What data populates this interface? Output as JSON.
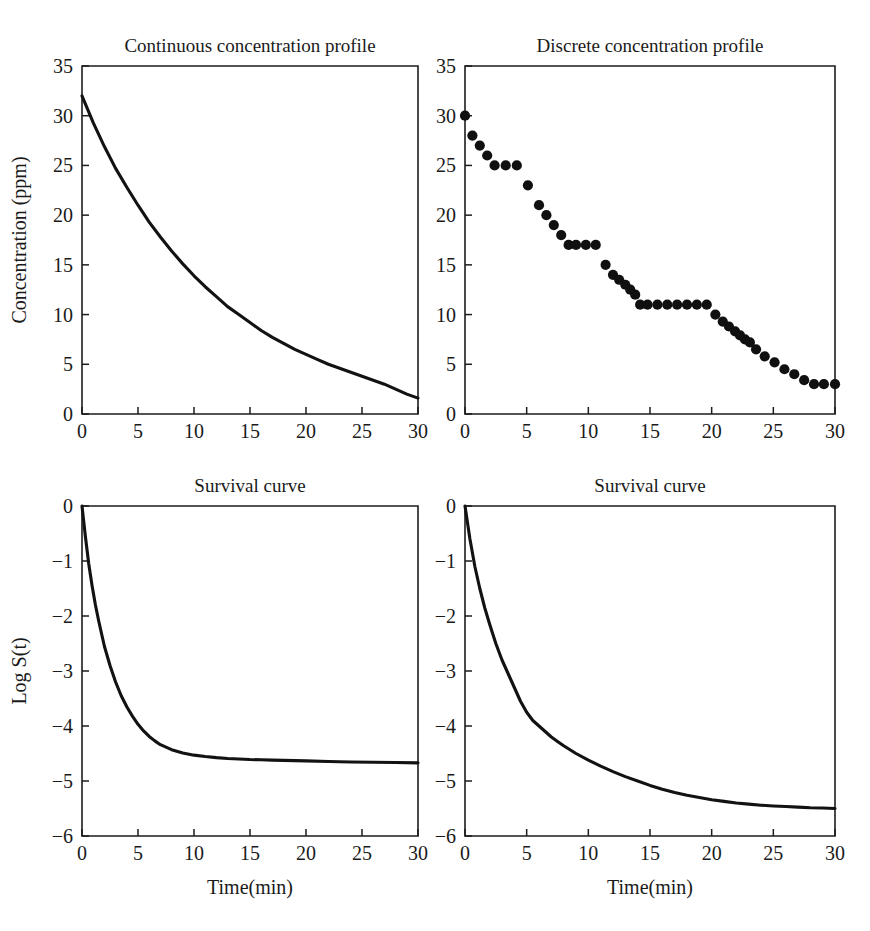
{
  "figure": {
    "background": "#ffffff",
    "line_color": "#121212",
    "axis_color": "#1d1d1d"
  },
  "panels": {
    "top_left": {
      "title": "Continuous concentration profile",
      "xlabel": "",
      "ylabel": "Concentration (ppm)"
    },
    "top_right": {
      "title": "Discrete concentration profile",
      "xlabel": "",
      "ylabel": ""
    },
    "bottom_left": {
      "title": "Survival curve",
      "xlabel": "Time(min)",
      "ylabel": "Log S(t)"
    },
    "bottom_right": {
      "title": "Survival curve",
      "xlabel": "Time(min)",
      "ylabel": ""
    }
  },
  "chart_data": [
    {
      "id": "continuous-concentration-profile",
      "type": "line",
      "title": "Continuous concentration profile",
      "xlabel": "",
      "ylabel": "Concentration (ppm)",
      "xlim": [
        0,
        30
      ],
      "ylim": [
        0,
        35
      ],
      "xticks": [
        0,
        5,
        10,
        15,
        20,
        25,
        30
      ],
      "yticks": [
        0,
        5,
        10,
        15,
        20,
        25,
        30,
        35
      ],
      "xticklabels": [
        "0",
        "5",
        "10",
        "15",
        "20",
        "25",
        "30"
      ],
      "yticklabels": [
        "0",
        "5",
        "10",
        "15",
        "20",
        "25",
        "30",
        "35"
      ],
      "grid": false,
      "legend": false,
      "series": [
        {
          "name": "concentration",
          "x": [
            0,
            1,
            2,
            3,
            4,
            5,
            6,
            7,
            8,
            9,
            10,
            11,
            12,
            13,
            14,
            15,
            16,
            17,
            18,
            19,
            20,
            21,
            22,
            23,
            24,
            25,
            26,
            27,
            28,
            29,
            30
          ],
          "y": [
            32.0,
            29.3,
            26.9,
            24.7,
            22.8,
            21.0,
            19.3,
            17.8,
            16.4,
            15.1,
            13.9,
            12.8,
            11.8,
            10.8,
            10.0,
            9.2,
            8.4,
            7.7,
            7.1,
            6.5,
            6.0,
            5.5,
            5.0,
            4.6,
            4.2,
            3.8,
            3.4,
            3.0,
            2.5,
            2.0,
            1.6
          ]
        }
      ]
    },
    {
      "id": "discrete-concentration-profile",
      "type": "scatter",
      "title": "Discrete concentration profile",
      "xlabel": "",
      "ylabel": "",
      "xlim": [
        0,
        30
      ],
      "ylim": [
        0,
        35
      ],
      "xticks": [
        0,
        5,
        10,
        15,
        20,
        25,
        30
      ],
      "yticks": [
        0,
        5,
        10,
        15,
        20,
        25,
        30,
        35
      ],
      "xticklabels": [
        "0",
        "5",
        "10",
        "15",
        "20",
        "25",
        "30"
      ],
      "yticklabels": [
        "0",
        "5",
        "10",
        "15",
        "20",
        "25",
        "30",
        "35"
      ],
      "grid": false,
      "legend": false,
      "marker": "filled-circle",
      "series": [
        {
          "name": "concentration",
          "x": [
            0,
            0.6,
            1.2,
            1.8,
            2.4,
            3.3,
            4.2,
            5.1,
            6.0,
            6.6,
            7.2,
            7.8,
            8.4,
            9.0,
            9.8,
            10.6,
            11.4,
            12.0,
            12.5,
            13.0,
            13.4,
            13.8,
            14.2,
            14.8,
            15.6,
            16.4,
            17.2,
            18.0,
            18.8,
            19.6,
            20.3,
            20.9,
            21.4,
            21.9,
            22.3,
            22.7,
            23.1,
            23.6,
            24.3,
            25.1,
            25.9,
            26.7,
            27.5,
            28.3,
            29.1,
            30.0
          ],
          "y": [
            30,
            28,
            27,
            26,
            25,
            25,
            25,
            23,
            21,
            20,
            19,
            18,
            17,
            17,
            17,
            17,
            15,
            14,
            13.5,
            13,
            12.5,
            12,
            11,
            11,
            11,
            11,
            11,
            11,
            11,
            11,
            10,
            9.3,
            8.8,
            8.3,
            7.9,
            7.5,
            7.2,
            6.5,
            5.8,
            5.2,
            4.5,
            4.0,
            3.4,
            3.0,
            3.0,
            3.0
          ]
        }
      ]
    },
    {
      "id": "survival-curve-continuous",
      "type": "line",
      "title": "Survival curve",
      "xlabel": "Time(min)",
      "ylabel": "Log S(t)",
      "xlim": [
        0,
        30
      ],
      "ylim": [
        -6,
        0
      ],
      "xticks": [
        0,
        5,
        10,
        15,
        20,
        25,
        30
      ],
      "yticks": [
        -6,
        -5,
        -4,
        -3,
        -2,
        -1,
        0
      ],
      "xticklabels": [
        "0",
        "5",
        "10",
        "15",
        "20",
        "25",
        "30"
      ],
      "yticklabels": [
        "−6",
        "−5",
        "−4",
        "−3",
        "−2",
        "−1",
        "0"
      ],
      "grid": false,
      "legend": false,
      "series": [
        {
          "name": "log-survival",
          "x": [
            0,
            0.3,
            0.6,
            0.9,
            1.2,
            1.5,
            2.0,
            2.5,
            3.0,
            3.5,
            4.0,
            4.5,
            5.0,
            5.5,
            6.0,
            6.5,
            7.0,
            8.0,
            9.0,
            10.0,
            11.0,
            12.0,
            13.0,
            14.0,
            15.0,
            16.0,
            17.0,
            18.0,
            19.0,
            20.0,
            22.0,
            24.0,
            26.0,
            28.0,
            30.0
          ],
          "y": [
            0.0,
            -0.55,
            -1.05,
            -1.45,
            -1.8,
            -2.1,
            -2.55,
            -2.9,
            -3.2,
            -3.45,
            -3.65,
            -3.82,
            -3.97,
            -4.09,
            -4.19,
            -4.27,
            -4.34,
            -4.43,
            -4.49,
            -4.53,
            -4.555,
            -4.575,
            -4.59,
            -4.6,
            -4.61,
            -4.615,
            -4.62,
            -4.625,
            -4.63,
            -4.635,
            -4.645,
            -4.655,
            -4.66,
            -4.665,
            -4.67
          ]
        }
      ]
    },
    {
      "id": "survival-curve-discrete",
      "type": "line",
      "title": "Survival curve",
      "xlabel": "Time(min)",
      "ylabel": "",
      "xlim": [
        0,
        30
      ],
      "ylim": [
        -6,
        0
      ],
      "xticks": [
        0,
        5,
        10,
        15,
        20,
        25,
        30
      ],
      "yticks": [
        -6,
        -5,
        -4,
        -3,
        -2,
        -1,
        0
      ],
      "xticklabels": [
        "0",
        "5",
        "10",
        "15",
        "20",
        "25",
        "30"
      ],
      "yticklabels": [
        "−6",
        "−5",
        "−4",
        "−3",
        "−2",
        "−1",
        "0"
      ],
      "grid": false,
      "legend": false,
      "series": [
        {
          "name": "log-survival",
          "x": [
            0,
            0.4,
            0.8,
            1.2,
            1.6,
            2.0,
            2.5,
            3.0,
            3.5,
            4.0,
            4.5,
            5.0,
            5.5,
            6.0,
            6.5,
            7.0,
            7.5,
            8.0,
            9.0,
            10.0,
            11.0,
            12.0,
            13.0,
            14.0,
            15.0,
            16.0,
            17.0,
            18.0,
            19.0,
            20.0,
            21.0,
            22.0,
            23.0,
            24.0,
            25.0,
            26.0,
            27.0,
            28.0,
            29.0,
            30.0
          ],
          "y": [
            0.0,
            -0.6,
            -1.1,
            -1.5,
            -1.85,
            -2.15,
            -2.5,
            -2.8,
            -3.05,
            -3.3,
            -3.55,
            -3.75,
            -3.9,
            -4.0,
            -4.1,
            -4.2,
            -4.28,
            -4.36,
            -4.5,
            -4.62,
            -4.73,
            -4.83,
            -4.92,
            -5.0,
            -5.08,
            -5.15,
            -5.21,
            -5.26,
            -5.3,
            -5.34,
            -5.37,
            -5.4,
            -5.42,
            -5.44,
            -5.455,
            -5.465,
            -5.475,
            -5.485,
            -5.49,
            -5.5
          ]
        }
      ]
    }
  ]
}
